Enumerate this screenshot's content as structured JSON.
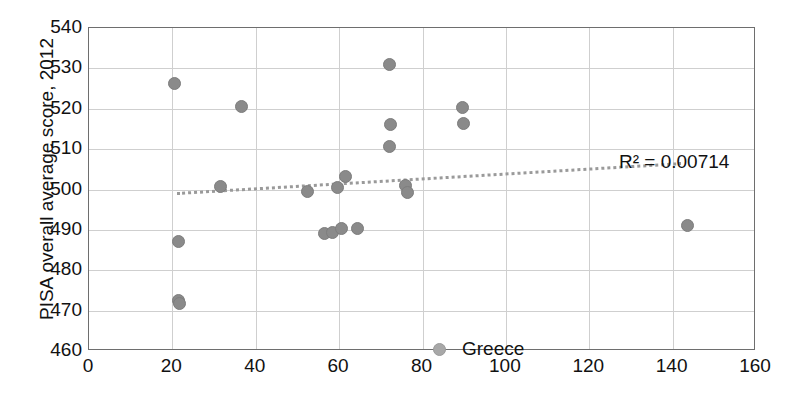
{
  "chart_data": {
    "type": "scatter",
    "title": "",
    "subtitle": "",
    "xlabel": "",
    "ylabel": "PISA overall average score, 2012",
    "xlim": [
      0,
      160
    ],
    "ylim": [
      460,
      540
    ],
    "xticks": [
      0,
      20,
      40,
      60,
      80,
      100,
      120,
      140,
      160
    ],
    "yticks": [
      460,
      470,
      480,
      490,
      500,
      510,
      520,
      530,
      540
    ],
    "grid": true,
    "legend_position": "inside-bottom-center",
    "series": [
      {
        "name": "Greece",
        "marker": "circle",
        "color": "#8a8a8a",
        "points": [
          {
            "x": 20.5,
            "y": 526.3
          },
          {
            "x": 21.5,
            "y": 487.0
          },
          {
            "x": 21.5,
            "y": 472.5
          },
          {
            "x": 21.8,
            "y": 471.8
          },
          {
            "x": 31.5,
            "y": 500.8
          },
          {
            "x": 36.5,
            "y": 520.5
          },
          {
            "x": 52.5,
            "y": 499.6
          },
          {
            "x": 56.5,
            "y": 489.0
          },
          {
            "x": 58.5,
            "y": 489.3
          },
          {
            "x": 59.5,
            "y": 500.4
          },
          {
            "x": 60.5,
            "y": 490.4
          },
          {
            "x": 61.5,
            "y": 503.2
          },
          {
            "x": 64.5,
            "y": 490.3
          },
          {
            "x": 72.0,
            "y": 531.0
          },
          {
            "x": 72.3,
            "y": 516.2
          },
          {
            "x": 72.0,
            "y": 510.6
          },
          {
            "x": 76.0,
            "y": 501.0
          },
          {
            "x": 76.5,
            "y": 499.2
          },
          {
            "x": 89.5,
            "y": 520.2
          },
          {
            "x": 89.8,
            "y": 516.4
          },
          {
            "x": 143.5,
            "y": 491.2
          }
        ]
      }
    ],
    "trendline": {
      "label": "R² = 0.00714",
      "r_squared": 0.00714,
      "style": "dotted",
      "color": "#9a9a9a",
      "x_start": 21.0,
      "y_start": 499.4,
      "x_end": 142.0,
      "y_end": 506.8
    },
    "legend": [
      {
        "label": "Greece",
        "marker": "circle",
        "color": "#a8a8a8"
      }
    ],
    "colors": {
      "marker": "#8a8a8a",
      "trendline": "#9a9a9a",
      "grid": "#cfcfcf",
      "frame": "#6e6e6e",
      "text": "#111111",
      "background": "#ffffff"
    }
  }
}
